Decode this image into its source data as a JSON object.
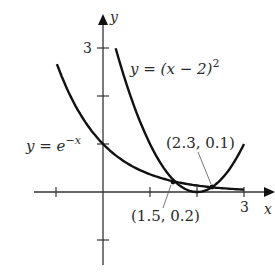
{
  "figure": {
    "axes": {
      "x_label": "x",
      "y_label": "y",
      "x_tick_labels": [
        {
          "value": 3,
          "text": "3"
        }
      ],
      "y_tick_labels": [
        {
          "value": 3,
          "text": "3"
        }
      ],
      "x_ticks": [
        -1,
        1,
        2,
        3
      ],
      "y_ticks": [
        -1,
        1,
        2,
        3
      ]
    },
    "curves": [
      {
        "name": "exp",
        "label_lhs": "y = e",
        "label_exp": "−x"
      },
      {
        "name": "parabola",
        "label_lhs": "y = (x − 2)",
        "label_exp": "2"
      }
    ],
    "annotations": [
      {
        "text": "(1.5, 0.2)",
        "point": [
          1.5,
          0.2
        ]
      },
      {
        "text": "(2.3, 0.1)",
        "point": [
          2.3,
          0.1
        ]
      }
    ]
  },
  "chart_data": {
    "type": "line",
    "title": "",
    "xlabel": "x",
    "ylabel": "y",
    "xlim": [
      -1.1,
      3.6
    ],
    "ylim": [
      -1.5,
      3.7
    ],
    "grid": false,
    "series": [
      {
        "name": "y = e^(-x)",
        "x": [
          -1,
          -0.5,
          0,
          0.5,
          1,
          1.5,
          2,
          2.5,
          3
        ],
        "y": [
          2.72,
          1.65,
          1.0,
          0.61,
          0.37,
          0.22,
          0.14,
          0.08,
          0.05
        ]
      },
      {
        "name": "y = (x - 2)^2",
        "x": [
          0.27,
          0.5,
          1,
          1.5,
          2,
          2.5,
          3
        ],
        "y": [
          3.0,
          2.25,
          1.0,
          0.25,
          0.0,
          0.25,
          1.0
        ]
      }
    ],
    "annotations": [
      {
        "text": "(1.5, 0.2)",
        "x": 1.5,
        "y": 0.2
      },
      {
        "text": "(2.3, 0.1)",
        "x": 2.3,
        "y": 0.1
      }
    ]
  }
}
